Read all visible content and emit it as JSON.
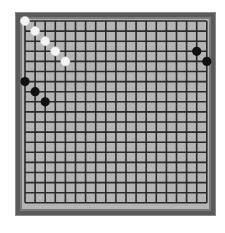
{
  "game": {
    "type": "go",
    "board_size": 19,
    "colors": {
      "board": "#b5b5b5",
      "grid_line": "#2a2a2a",
      "frame": "#5a5a5a",
      "black_stone": "#111111",
      "white_stone": "#f4f4f4"
    },
    "stones": [
      {
        "color": "white",
        "col": 0,
        "row": 0
      },
      {
        "color": "white",
        "col": 1,
        "row": 1
      },
      {
        "color": "white",
        "col": 2,
        "row": 2
      },
      {
        "color": "white",
        "col": 3,
        "row": 3
      },
      {
        "color": "white",
        "col": 4,
        "row": 4
      },
      {
        "color": "black",
        "col": 0,
        "row": 6
      },
      {
        "color": "black",
        "col": 1,
        "row": 7
      },
      {
        "color": "black",
        "col": 2,
        "row": 8
      },
      {
        "color": "black",
        "col": 17,
        "row": 3
      },
      {
        "color": "black",
        "col": 18,
        "row": 4
      }
    ]
  }
}
